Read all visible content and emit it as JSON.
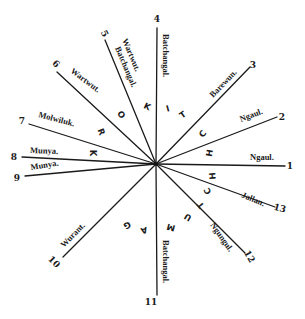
{
  "diagram": {
    "center": {
      "x": 156,
      "y": 164
    },
    "rays": [
      {
        "num": "1",
        "end": [
          285,
          166
        ],
        "num_pos": [
          290,
          169
        ],
        "num_rot": 0,
        "label": "Ngaul.",
        "label_pos": [
          250,
          160
        ],
        "label_rot": 0
      },
      {
        "num": "2",
        "end": [
          277,
          117
        ],
        "num_pos": [
          282,
          120
        ],
        "num_rot": 0,
        "label": "Ngaul.",
        "label_pos": [
          241,
          122
        ],
        "label_rot": -21
      },
      {
        "num": "3",
        "end": [
          250,
          67
        ],
        "num_pos": [
          253,
          68
        ],
        "num_rot": 0,
        "label": "Barewun.",
        "label_pos": [
          213,
          98
        ],
        "label_rot": -46
      },
      {
        "num": "4",
        "end": [
          157,
          28
        ],
        "num_pos": [
          157,
          22
        ],
        "num_rot": 0,
        "label": "Batchangal.",
        "label_pos": [
          163,
          34
        ],
        "label_rot": 90
      },
      {
        "num": "5",
        "end": [
          105,
          40
        ],
        "num_pos": [
          102,
          35
        ],
        "num_rot": 62,
        "label": "Wartwut.",
        "label_pos": [
          122,
          40
        ],
        "label_rot": 67,
        "label2": "Batchangal.",
        "label2_pos": [
          115,
          48
        ],
        "label2_rot": 67
      },
      {
        "num": "6",
        "end": [
          57,
          72
        ],
        "num_pos": [
          54,
          66
        ],
        "num_rot": 45,
        "label": "Wartwut.",
        "label_pos": [
          70,
          72
        ],
        "label_rot": 37
      },
      {
        "num": "7",
        "end": [
          29,
          124
        ],
        "num_pos": [
          22,
          124
        ],
        "num_rot": 0,
        "label": "Molwiluk.",
        "label_pos": [
          38,
          117
        ],
        "label_rot": 15
      },
      {
        "num": "8",
        "end": [
          22,
          157
        ],
        "num_pos": [
          14,
          160
        ],
        "num_rot": 0,
        "label": "Munya.",
        "label_pos": [
          30,
          153
        ],
        "label_rot": 2
      },
      {
        "num": "9",
        "end": [
          25,
          176
        ],
        "num_pos": [
          17,
          181
        ],
        "num_rot": 0,
        "label": "Munya.",
        "label_pos": [
          31,
          170
        ],
        "label_rot": -9
      },
      {
        "num": "10",
        "end": [
          63,
          257
        ],
        "num_pos": [
          52,
          264
        ],
        "num_rot": 45,
        "label": "Wurant.",
        "label_pos": [
          64,
          248
        ],
        "label_rot": -46
      },
      {
        "num": "11",
        "end": [
          157,
          295
        ],
        "num_pos": [
          151,
          305
        ],
        "num_rot": 0,
        "label": "Batchangal.",
        "label_pos": [
          163,
          240
        ],
        "label_rot": 90
      },
      {
        "num": "12",
        "end": [
          245,
          253
        ],
        "num_pos": [
          247,
          258
        ],
        "num_rot": 60,
        "label": "Ngungul.",
        "label_pos": [
          210,
          225
        ],
        "label_rot": 55
      },
      {
        "num": "13",
        "end": [
          275,
          207
        ],
        "num_pos": [
          279,
          211
        ],
        "num_rot": 15,
        "label": "Jallan.",
        "label_pos": [
          241,
          197
        ],
        "label_rot": 23
      }
    ],
    "arc_letters_upper": {
      "word": "KROKITCHH",
      "letters": [
        {
          "ch": "K",
          "pos": [
            92,
            153
          ],
          "rot": 90
        },
        {
          "ch": "R",
          "pos": [
            101,
            132
          ],
          "rot": 70
        },
        {
          "ch": "O",
          "pos": [
            121,
            115
          ],
          "rot": 50
        },
        {
          "ch": "K",
          "pos": [
            147,
            107
          ],
          "rot": 25
        },
        {
          "ch": "I",
          "pos": [
            168,
            109
          ],
          "rot": -15
        },
        {
          "ch": "T",
          "pos": [
            183,
            115
          ],
          "rot": -35
        },
        {
          "ch": "C",
          "pos": [
            203,
            134
          ],
          "rot": -55
        },
        {
          "ch": "H",
          "pos": [
            210,
            153
          ],
          "rot": -80
        }
      ]
    },
    "arc_letters_lower": {
      "word": "GAMUTCHH",
      "letters": [
        {
          "ch": "H",
          "pos": [
            213,
            176
          ],
          "rot": -95
        },
        {
          "ch": "C",
          "pos": [
            208,
            191
          ],
          "rot": -115
        },
        {
          "ch": "T",
          "pos": [
            201,
            205
          ],
          "rot": -130
        },
        {
          "ch": "U",
          "pos": [
            188,
            217
          ],
          "rot": -150
        },
        {
          "ch": "M",
          "pos": [
            171,
            227
          ],
          "rot": -165
        },
        {
          "ch": "A",
          "pos": [
            144,
            230
          ],
          "rot": 165
        },
        {
          "ch": "G",
          "pos": [
            127,
            225
          ],
          "rot": 150
        }
      ]
    }
  }
}
